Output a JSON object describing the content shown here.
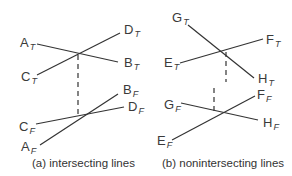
{
  "figure": {
    "panels": [
      {
        "id": "a",
        "caption": "(a) intersecting lines",
        "labels": {
          "A_T": {
            "letter": "A",
            "sub": "T"
          },
          "B_T": {
            "letter": "B",
            "sub": "T"
          },
          "C_T": {
            "letter": "C",
            "sub": "T"
          },
          "D_T": {
            "letter": "D",
            "sub": "T"
          },
          "A_F": {
            "letter": "A",
            "sub": "F"
          },
          "B_F": {
            "letter": "B",
            "sub": "F"
          },
          "C_F": {
            "letter": "C",
            "sub": "F"
          },
          "D_F": {
            "letter": "D",
            "sub": "F"
          }
        }
      },
      {
        "id": "b",
        "caption": "(b) nonintersecting lines",
        "labels": {
          "G_T": {
            "letter": "G",
            "sub": "T"
          },
          "F_T": {
            "letter": "F",
            "sub": "T"
          },
          "E_T": {
            "letter": "E",
            "sub": "T"
          },
          "H_T": {
            "letter": "H",
            "sub": "T"
          },
          "G_F": {
            "letter": "G",
            "sub": "F"
          },
          "F_F": {
            "letter": "F",
            "sub": "F"
          },
          "H_F": {
            "letter": "H",
            "sub": "F"
          },
          "E_F": {
            "letter": "E",
            "sub": "F"
          }
        }
      }
    ],
    "line_color": "#333333"
  }
}
